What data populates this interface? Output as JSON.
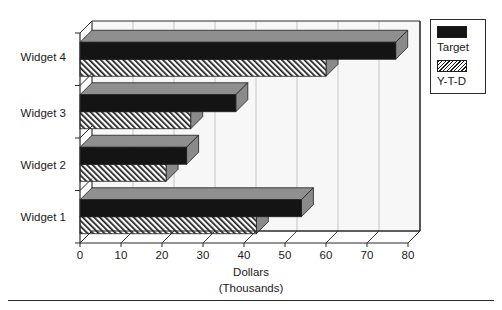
{
  "chart_data": {
    "type": "bar",
    "orientation": "horizontal",
    "title": "",
    "subtitle": "",
    "xlabel": "Dollars",
    "xlabel_line2": "(Thousands)",
    "ylabel": "",
    "categories": [
      "Widget 1",
      "Widget 2",
      "Widget 3",
      "Widget 4"
    ],
    "series": [
      {
        "name": "Target",
        "values": [
          54,
          26,
          38,
          77
        ],
        "color": "#141414",
        "fill": "solid"
      },
      {
        "name": "Y-T-D",
        "values": [
          43,
          21,
          27,
          60
        ],
        "color": "#1b1b1b",
        "fill": "diagonal-hatch"
      }
    ],
    "xlim": [
      0,
      80
    ],
    "xticks": [
      0,
      10,
      20,
      30,
      40,
      50,
      60,
      70,
      80
    ],
    "xtick_labels": [
      "0",
      "10",
      "20",
      "30",
      "40",
      "50",
      "60",
      "70",
      "80"
    ],
    "grid": true,
    "grid_axis": "x",
    "legend_position": "right-top",
    "style": "3d-bar"
  },
  "legend": {
    "entries": [
      {
        "label": "Target",
        "swatch": "solid-black"
      },
      {
        "label": "Y-T-D",
        "swatch": "diagonal-hatch"
      }
    ]
  },
  "colors": {
    "bar_target": "#141414",
    "bar_ytd": "#1b1b1b",
    "axis": "#2b2b2b",
    "grid": "#b9b9b9",
    "plot_background": "#f7f7f7",
    "page_background": "#ffffff",
    "rule": "#2a2a2a"
  }
}
